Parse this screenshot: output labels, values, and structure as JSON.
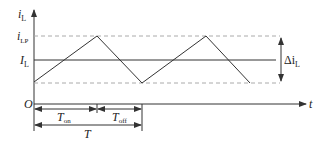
{
  "diagram": {
    "y_axis_label": "i",
    "y_axis_label_sub": "L",
    "x_axis_label": "t",
    "origin_label": "O",
    "peak_label": "i",
    "peak_label_sub": "LP",
    "avg_label": "I",
    "avg_label_sub": "L",
    "ripple_label": "Δi",
    "ripple_label_sub": "L",
    "ton_label": "T",
    "ton_label_sub": "on",
    "toff_label": "T",
    "toff_label_sub": "off",
    "period_label": "T",
    "colors": {
      "line": "#333333",
      "dashed": "#aaaaaa",
      "text": "#222222"
    },
    "waveform_points": [
      [
        34,
        82
      ],
      [
        97,
        36
      ],
      [
        142,
        83
      ],
      [
        206,
        36
      ],
      [
        250,
        83
      ]
    ]
  }
}
